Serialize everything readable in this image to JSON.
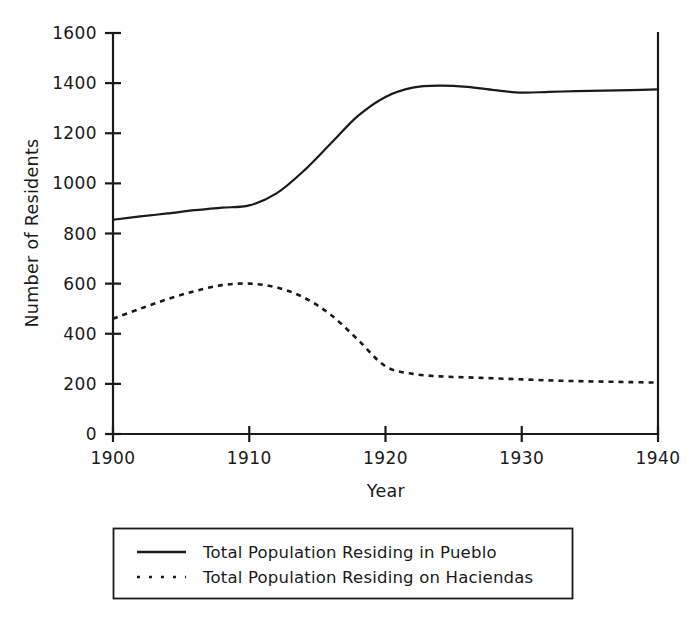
{
  "chart_data": {
    "type": "line",
    "title": "",
    "subtitle": "",
    "xlabel": "Year",
    "ylabel": "Number of Residents",
    "xlim": [
      1900,
      1940
    ],
    "ylim": [
      0,
      1600
    ],
    "x_ticks": [
      1900,
      1910,
      1920,
      1930,
      1940
    ],
    "x_tick_labels": [
      "1900",
      "1910",
      "1920",
      "1930",
      "1940"
    ],
    "y_ticks": [
      0,
      200,
      400,
      600,
      800,
      1000,
      1200,
      1400,
      1600
    ],
    "y_tick_labels": [
      "0",
      "200",
      "400",
      "600",
      "800",
      "1000",
      "1200",
      "1400",
      "1600"
    ],
    "grid": false,
    "legend_position": "below-axes",
    "spines": [
      "left",
      "bottom",
      "right"
    ],
    "x": [
      1900,
      1902,
      1904,
      1906,
      1908,
      1910,
      1912,
      1914,
      1916,
      1918,
      1920,
      1922,
      1924,
      1926,
      1928,
      1930,
      1932,
      1934,
      1936,
      1938,
      1940
    ],
    "series": [
      {
        "name": "Total Population Residing in Pueblo",
        "style": "solid",
        "color": "#1a1a1a",
        "values": [
          855,
          868,
          880,
          893,
          903,
          912,
          960,
          1050,
          1160,
          1270,
          1345,
          1382,
          1390,
          1385,
          1372,
          1362,
          1365,
          1368,
          1370,
          1372,
          1375
        ]
      },
      {
        "name": "Total Population Residing on Haciendas",
        "style": "dotted",
        "color": "#1a1a1a",
        "values": [
          460,
          500,
          538,
          570,
          594,
          600,
          585,
          545,
          475,
          375,
          270,
          240,
          230,
          226,
          222,
          218,
          214,
          211,
          209,
          207,
          205
        ]
      }
    ],
    "annotations": []
  },
  "legend": {
    "entries": [
      {
        "label": "Total Population Residing in Pueblo",
        "marker": "solid-line-swatch"
      },
      {
        "label": "Total Population Residing on Haciendas",
        "marker": "dotted-line-swatch"
      }
    ]
  }
}
